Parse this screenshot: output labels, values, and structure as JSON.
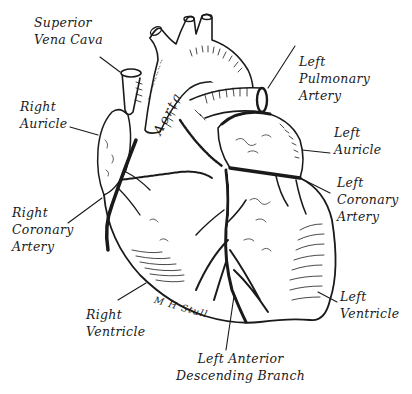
{
  "diagram": {
    "style": "black-and-white pen illustration",
    "colors": {
      "ink": "#1a1a1a",
      "background": "#ffffff"
    },
    "signature": "M H Stull",
    "vessel_text": "Aorta",
    "labels": {
      "superior_vena_cava": "Superior\nVena Cava",
      "right_auricle": "Right\nAuricle",
      "right_coronary_artery": "Right\nCoronary\nArtery",
      "right_ventricle": "Right\nVentricle",
      "left_pulmonary_artery": "Left\nPulmonary\nArtery",
      "left_auricle": "Left\nAuricle",
      "left_coronary_artery": "Left\nCoronary\nArtery",
      "left_ventricle": "Left\nVentricle",
      "left_anterior_descending_branch": "Left Anterior\nDescending Branch"
    }
  }
}
